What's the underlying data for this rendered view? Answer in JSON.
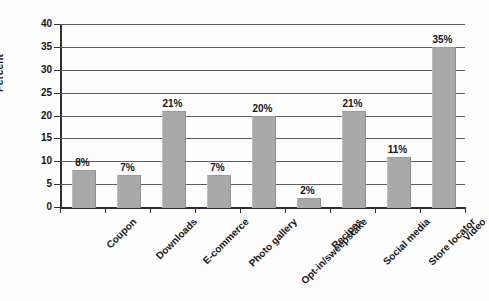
{
  "chart_data": {
    "type": "bar",
    "title": "",
    "subtitle": "",
    "xlabel": "",
    "ylabel": "Percent",
    "ylim": [
      0,
      40
    ],
    "ytick_step": 5,
    "yticks": [
      "0",
      "5",
      "10",
      "15",
      "20",
      "25",
      "30",
      "35",
      "40"
    ],
    "grid": true,
    "legend": "none",
    "bar_color": "#a9a9a9",
    "categories": [
      "Coupon",
      "Downloads",
      "E-commerce",
      "Photo gallery",
      "Opt-in/sweepstake",
      "Recipes",
      "Social media",
      "Store locator",
      "Video"
    ],
    "values": [
      8,
      7,
      21,
      7,
      20,
      2,
      21,
      11,
      35
    ],
    "data_labels": [
      "8%",
      "7%",
      "21%",
      "7%",
      "20%",
      "2%",
      "21%",
      "11%",
      "35%"
    ]
  }
}
